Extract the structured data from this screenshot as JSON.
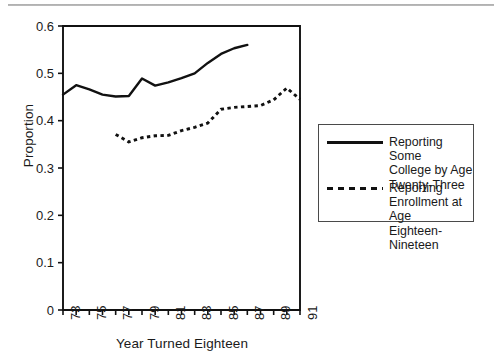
{
  "figure": {
    "background": "#ffffff",
    "axis_color": "#111111",
    "top_rule_color": "#9a9a9a"
  },
  "axes": {
    "ylabel": "Proportion",
    "xlabel": "Year Turned Eighteen",
    "ytick_labels": [
      "0.6",
      "0.5",
      "0.4",
      "0.3",
      "0.2",
      "0.1",
      "0"
    ],
    "xtick_labels": [
      "73",
      "75",
      "77",
      "79",
      "81",
      "83",
      "85",
      "87",
      "89",
      "91"
    ]
  },
  "legend": {
    "position": "right",
    "entries": [
      {
        "style": "solid",
        "sample_name": "solid-line-sample",
        "label_lines": [
          "Reporting Some",
          "College by Age",
          "Twenty-Three"
        ],
        "label": "Reporting Some College by Age Twenty-Three"
      },
      {
        "style": "dashed",
        "sample_name": "dashed-line-sample",
        "label_lines": [
          "Reporting",
          "Enrollment at Age",
          "Eighteen-Nineteen"
        ],
        "label": "Reporting Enrollment at Age Eighteen-Nineteen"
      }
    ]
  },
  "chart_data": {
    "type": "line",
    "title": "",
    "xlabel": "Year Turned Eighteen",
    "ylabel": "Proportion",
    "xlim": [
      73,
      91
    ],
    "ylim": [
      0,
      0.6
    ],
    "ytick_values": [
      0,
      0.1,
      0.2,
      0.3,
      0.4,
      0.5,
      0.6
    ],
    "xtick_values": [
      73,
      74,
      75,
      76,
      77,
      78,
      79,
      80,
      81,
      82,
      83,
      84,
      85,
      86,
      87,
      88,
      89,
      90,
      91
    ],
    "xtick_labeled": [
      73,
      75,
      77,
      79,
      81,
      83,
      85,
      87,
      89,
      91
    ],
    "grid": false,
    "legend_position": "right",
    "series": [
      {
        "name": "Reporting Some College by Age Twenty-Three",
        "style": "solid",
        "color": "#111111",
        "x": [
          73,
          74,
          75,
          76,
          77,
          78,
          79,
          80,
          81,
          82,
          83,
          84,
          85,
          86,
          87
        ],
        "values": [
          0.455,
          0.475,
          0.466,
          0.455,
          0.451,
          0.452,
          0.489,
          0.474,
          0.481,
          0.49,
          0.5,
          0.522,
          0.541,
          0.553,
          0.56
        ]
      },
      {
        "name": "Reporting Enrollment at Age Eighteen-Nineteen",
        "style": "dashed",
        "color": "#111111",
        "x": [
          77,
          78,
          79,
          80,
          81,
          82,
          83,
          84,
          85,
          86,
          87,
          88,
          89,
          90,
          91
        ],
        "values": [
          0.371,
          0.355,
          0.364,
          0.368,
          0.369,
          0.379,
          0.386,
          0.395,
          0.424,
          0.428,
          0.43,
          0.432,
          0.444,
          0.469,
          0.445
        ]
      }
    ]
  }
}
